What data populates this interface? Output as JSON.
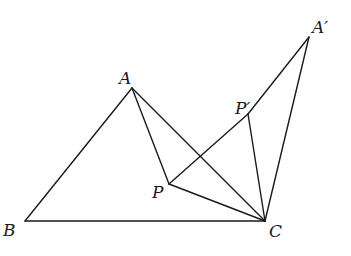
{
  "diagram": {
    "type": "geometry-figure",
    "points": [
      {
        "id": "A",
        "label": "A",
        "x": 132,
        "y": 88,
        "lx": 119,
        "ly": 84
      },
      {
        "id": "B",
        "label": "B",
        "x": 25,
        "y": 221,
        "lx": 3,
        "ly": 236
      },
      {
        "id": "C",
        "label": "C",
        "x": 265,
        "y": 221,
        "lx": 269,
        "ly": 237
      },
      {
        "id": "P",
        "label": "P",
        "x": 169,
        "y": 184,
        "lx": 152,
        "ly": 198
      },
      {
        "id": "Pp",
        "label": "P′",
        "x": 248,
        "y": 114,
        "lx": 235,
        "ly": 114
      },
      {
        "id": "Ap",
        "label": "A′",
        "x": 309,
        "y": 37,
        "lx": 312,
        "ly": 33
      }
    ],
    "edges": [
      [
        "A",
        "B"
      ],
      [
        "B",
        "C"
      ],
      [
        "A",
        "C"
      ],
      [
        "A",
        "P"
      ],
      [
        "P",
        "C"
      ],
      [
        "P",
        "Pp"
      ],
      [
        "Pp",
        "C"
      ],
      [
        "Pp",
        "Ap"
      ],
      [
        "Ap",
        "C"
      ]
    ]
  }
}
